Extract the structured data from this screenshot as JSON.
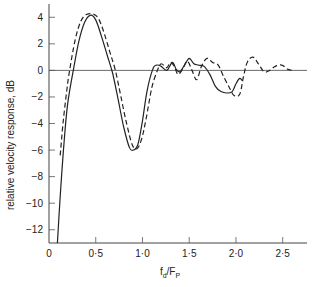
{
  "chart_data": {
    "type": "line",
    "title": "",
    "xlabel": "f_d/F_P",
    "xlabel_main": "f",
    "xlabel_sub1": "d",
    "xlabel_slash": "/F",
    "xlabel_sub2": "P",
    "ylabel": "relative velocity response, dB",
    "xlim": [
      0,
      2.76
    ],
    "ylim": [
      -13,
      5
    ],
    "x_ticks": [
      0,
      0.5,
      1.0,
      1.5,
      2.0,
      2.5
    ],
    "x_tick_labels": [
      "0",
      "0·5",
      "1·0",
      "1·5",
      "2·0",
      "2·5"
    ],
    "y_ticks": [
      4,
      2,
      0,
      -2,
      -4,
      -6,
      -8,
      -10,
      -12
    ],
    "y_tick_labels": [
      "4",
      "2",
      "0",
      "−2",
      "−4",
      "−6",
      "−8",
      "−10",
      "−12"
    ],
    "grid": false,
    "reference_line_y": 0,
    "legend": "none",
    "series": [
      {
        "name": "solid",
        "style": "solid",
        "x": [
          0.09,
          0.12,
          0.16,
          0.2,
          0.26,
          0.32,
          0.38,
          0.44,
          0.5,
          0.56,
          0.62,
          0.68,
          0.74,
          0.8,
          0.86,
          0.9,
          0.95,
          1.0,
          1.05,
          1.11,
          1.15,
          1.2,
          1.26,
          1.32,
          1.36,
          1.4,
          1.45,
          1.5,
          1.55,
          1.6,
          1.66,
          1.72,
          1.78,
          1.84,
          1.9,
          1.96,
          2.0,
          2.04,
          2.07
        ],
        "values": [
          -13,
          -9.5,
          -5.5,
          -2.5,
          0,
          2.2,
          3.6,
          4.15,
          3.8,
          2.6,
          1.2,
          -0.2,
          -2.2,
          -4.3,
          -5.8,
          -6.0,
          -5.6,
          -3.8,
          -1.5,
          0.1,
          0.4,
          0.3,
          0.0,
          0.6,
          0.1,
          -0.1,
          0.4,
          0.9,
          0.5,
          0.4,
          0.3,
          -0.3,
          -1.2,
          -1.6,
          -1.7,
          -1.6,
          -1.0,
          -0.6,
          -0.8
        ]
      },
      {
        "name": "dashed",
        "style": "dashed",
        "x": [
          0.12,
          0.15,
          0.19,
          0.22,
          0.28,
          0.34,
          0.4,
          0.47,
          0.53,
          0.59,
          0.65,
          0.71,
          0.77,
          0.83,
          0.89,
          0.94,
          0.99,
          1.04,
          1.1,
          1.16,
          1.2,
          1.26,
          1.3,
          1.34,
          1.38,
          1.43,
          1.48,
          1.53,
          1.58,
          1.63,
          1.69,
          1.75,
          1.81,
          1.87,
          1.93,
          1.98,
          2.04,
          2.08,
          2.12,
          2.18,
          2.24,
          2.3,
          2.36,
          2.42,
          2.49,
          2.55,
          2.6
        ],
        "values": [
          -6.4,
          -4.0,
          -1.5,
          0,
          2.3,
          3.7,
          4.2,
          4.25,
          3.9,
          2.8,
          1.4,
          0.0,
          -2.0,
          -4.0,
          -5.6,
          -5.9,
          -5.2,
          -3.6,
          -1.3,
          0.0,
          0.5,
          0.2,
          0.6,
          0.3,
          -0.3,
          0.1,
          0.7,
          0.0,
          -0.7,
          0.3,
          0.9,
          0.6,
          0.4,
          -0.5,
          -1.3,
          -1.9,
          -1.8,
          -0.5,
          0.6,
          1.0,
          0.5,
          -0.1,
          0.0,
          0.3,
          0.4,
          0.1,
          0.0
        ]
      }
    ]
  }
}
